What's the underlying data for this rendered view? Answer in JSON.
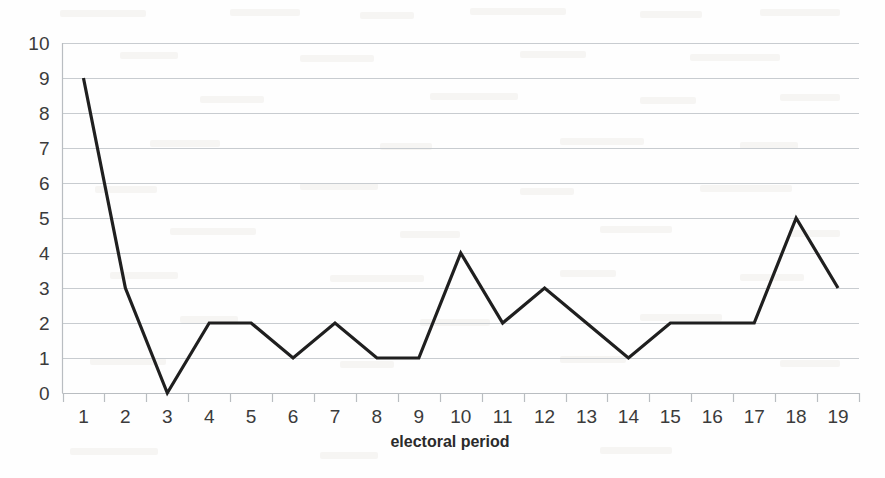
{
  "chart_data": {
    "type": "line",
    "title": "",
    "subtitle": "",
    "xlabel": "electoral period",
    "ylabel": "",
    "categories": [
      "1",
      "2",
      "3",
      "4",
      "5",
      "6",
      "7",
      "8",
      "9",
      "10",
      "11",
      "12",
      "13",
      "14",
      "15",
      "16",
      "17",
      "18",
      "19"
    ],
    "values": [
      9,
      3,
      0,
      2,
      2,
      1,
      2,
      1,
      1,
      4,
      2,
      3,
      2,
      1,
      2,
      2,
      2,
      5,
      3
    ],
    "series": [
      {
        "name": "",
        "values": [
          9,
          3,
          0,
          2,
          2,
          1,
          2,
          1,
          1,
          4,
          2,
          3,
          2,
          1,
          2,
          2,
          2,
          5,
          3
        ]
      }
    ],
    "ylim": [
      0,
      10
    ],
    "ytick_labels": [
      "0",
      "1",
      "2",
      "3",
      "4",
      "5",
      "6",
      "7",
      "8",
      "9",
      "10"
    ],
    "ytick_values": [
      0,
      1,
      2,
      3,
      4,
      5,
      6,
      7,
      8,
      9,
      10
    ],
    "grid": "horizontal",
    "legend": "none",
    "legend_position": "",
    "annotations": [],
    "line_color": "#1f1f1f",
    "gridline_color": "#c8ccd0",
    "background_color": "#fefefe",
    "markers": "none"
  },
  "axis": {
    "x_title": "electoral period"
  },
  "icons": {
    "chart_kind": "line-chart-icon"
  }
}
